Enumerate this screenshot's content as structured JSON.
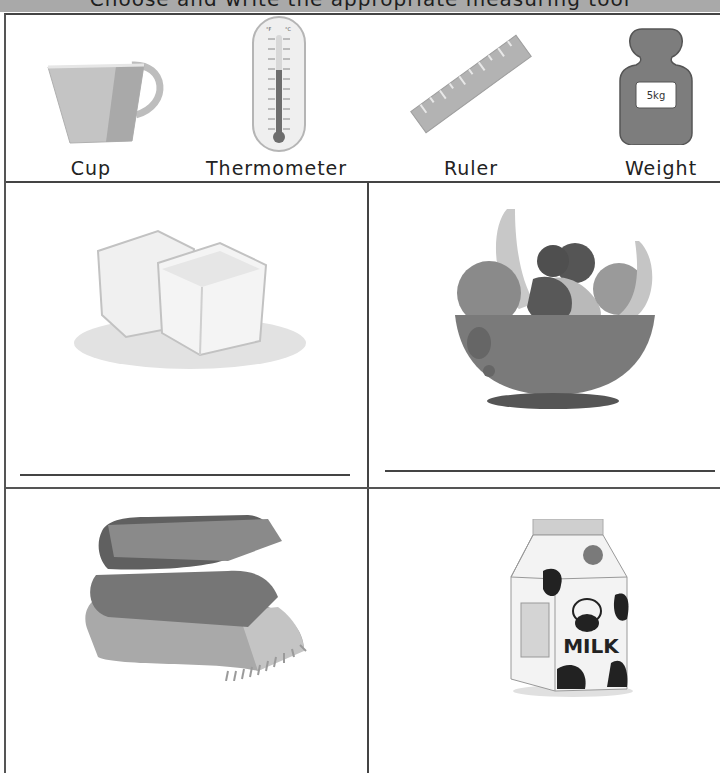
{
  "banner": {
    "title": "Choose and write the appropriate measuring tool",
    "background": "#a9a9a9"
  },
  "tools": [
    {
      "label": "Cup",
      "icon": "cup-icon"
    },
    {
      "label": "Thermometer",
      "icon": "thermometer-icon"
    },
    {
      "label": "Ruler",
      "icon": "ruler-icon"
    },
    {
      "label": "Weight",
      "icon": "weight-icon",
      "badge": "5kg"
    }
  ],
  "thermometer": {
    "units": [
      "°F",
      "°C"
    ],
    "fahrenheit_ticks": [
      "120",
      "100",
      "80",
      "60",
      "40",
      "20",
      "0",
      "20",
      "40",
      "60"
    ],
    "celsius_ticks": [
      "50",
      "40",
      "30",
      "20",
      "10",
      "0",
      "10",
      "20",
      "30",
      "40",
      "50"
    ]
  },
  "questions": [
    {
      "item": "Ice cubes",
      "icon": "ice-cubes-icon",
      "answer": ""
    },
    {
      "item": "Fruit bowl",
      "icon": "fruit-bowl-icon",
      "answer": ""
    },
    {
      "item": "Blankets",
      "icon": "blankets-icon",
      "answer": ""
    },
    {
      "item": "Milk carton",
      "icon": "milk-carton-icon",
      "label": "MILK",
      "answer": ""
    }
  ]
}
